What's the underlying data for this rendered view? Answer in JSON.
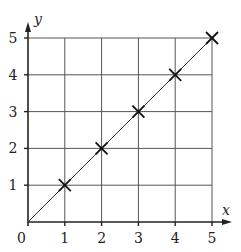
{
  "chart_data": {
    "type": "scatter",
    "title": "",
    "xlabel": "x",
    "ylabel": "y",
    "xlim": [
      0,
      5
    ],
    "ylim": [
      0,
      5
    ],
    "grid": true,
    "x_ticks": [
      "1",
      "2",
      "3",
      "4",
      "5"
    ],
    "y_ticks": [
      "1",
      "2",
      "3",
      "4",
      "5"
    ],
    "origin_label": "0",
    "points": [
      {
        "x": 1,
        "y": 1
      },
      {
        "x": 2,
        "y": 2
      },
      {
        "x": 3,
        "y": 3
      },
      {
        "x": 4,
        "y": 4
      },
      {
        "x": 5,
        "y": 5
      }
    ],
    "line": {
      "from": [
        0,
        0
      ],
      "to": [
        5,
        5
      ],
      "label": "y = x"
    },
    "marker": "x",
    "colors": {
      "line": "#333333",
      "grid": "#555555",
      "axis": "#222222",
      "marker": "#111111"
    }
  }
}
